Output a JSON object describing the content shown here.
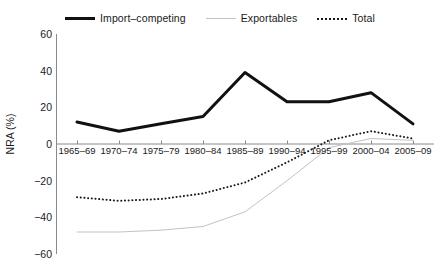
{
  "chart_data": {
    "type": "line",
    "title": "",
    "xlabel": "",
    "ylabel": "NRA (%)",
    "categories": [
      "1965–69",
      "1970–74",
      "1975–79",
      "1980–84",
      "1985–89",
      "1990–94",
      "1995–99",
      "2000–04",
      "2005–09"
    ],
    "ylim": [
      -60,
      60
    ],
    "yticks": [
      60,
      40,
      20,
      0,
      -20,
      -40,
      -60
    ],
    "ytick_labels": [
      "60",
      "40",
      "20",
      "0",
      "−20",
      "−40",
      "−60"
    ],
    "grid": false,
    "legend_position": "top-center",
    "zero_line": 0,
    "series": [
      {
        "name": "Import–competing",
        "style": "solid",
        "width": 3,
        "color": "#111111",
        "values": [
          12,
          7,
          11,
          15,
          39,
          23,
          23,
          28,
          11
        ]
      },
      {
        "name": "Exportables",
        "style": "solid",
        "width": 1,
        "color": "#c3c3c3",
        "values": [
          -48,
          -48,
          -47,
          -45,
          -37,
          -20,
          -2,
          3,
          2
        ]
      },
      {
        "name": "Total",
        "style": "dotted",
        "width": 2,
        "color": "#1a1a1a",
        "values": [
          -29,
          -31,
          -30,
          -27,
          -21,
          -10,
          2,
          7,
          3
        ]
      }
    ]
  },
  "legend": {
    "entries": [
      {
        "label": "Import–competing",
        "key": "line-solid-thick-icon"
      },
      {
        "label": "Exportables",
        "key": "line-solid-thin-icon"
      },
      {
        "label": "Total",
        "key": "line-dotted-icon"
      }
    ]
  },
  "axes": {
    "y_title": "NRA (%)"
  }
}
